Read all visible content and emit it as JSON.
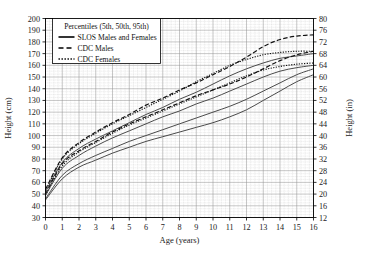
{
  "chart_data": {
    "type": "line",
    "title": "",
    "xlabel": "Age (years)",
    "ylabel": "Height (cm)",
    "ylabel_secondary": "Height (in)",
    "xlim": [
      0,
      16
    ],
    "ylim": [
      30,
      200
    ],
    "ylim_secondary": [
      12,
      80
    ],
    "xticks": [
      0,
      1,
      2,
      3,
      4,
      5,
      6,
      7,
      8,
      9,
      10,
      11,
      12,
      13,
      14,
      15,
      16
    ],
    "yticks": [
      30,
      40,
      50,
      60,
      70,
      80,
      90,
      100,
      110,
      120,
      130,
      140,
      150,
      160,
      170,
      180,
      190,
      200
    ],
    "yticks_secondary": [
      12,
      16,
      20,
      24,
      28,
      32,
      36,
      40,
      44,
      48,
      52,
      56,
      60,
      64,
      68,
      72,
      76,
      80
    ],
    "grid": true,
    "minor_grid_divisions": 4,
    "legend_position": "top-left",
    "legend_title": "Percentiles (5th, 50th, 95th)",
    "legend": [
      {
        "label": "SLOS Males and Females",
        "style": "solid"
      },
      {
        "label": "CDC Males",
        "style": "dashed"
      },
      {
        "label": "CDC Females",
        "style": "dotted"
      }
    ],
    "x": [
      0,
      1,
      2,
      3,
      4,
      5,
      6,
      7,
      8,
      9,
      10,
      11,
      12,
      13,
      14,
      15,
      16
    ],
    "series": [
      {
        "name": "CDC Males 95th",
        "style": "dashed",
        "values": [
          54,
          81,
          94,
          103,
          111,
          118,
          126,
          132,
          139,
          145,
          152,
          159,
          167,
          176,
          182,
          185,
          186
        ]
      },
      {
        "name": "CDC Females 95th",
        "style": "dotted",
        "values": [
          53,
          80,
          93,
          102,
          110,
          117,
          124,
          131,
          138,
          146,
          153,
          160,
          165,
          169,
          171,
          172,
          172
        ]
      },
      {
        "name": "SLOS Males and Females 95th",
        "style": "solid",
        "values": [
          52,
          77,
          89,
          97,
          104,
          111,
          118,
          124,
          131,
          137,
          144,
          151,
          157,
          162,
          166,
          168,
          170
        ]
      },
      {
        "name": "CDC Males 50th",
        "style": "dashed",
        "values": [
          50,
          76,
          87,
          95,
          103,
          110,
          116,
          122,
          128,
          134,
          139,
          144,
          150,
          157,
          164,
          169,
          172
        ]
      },
      {
        "name": "CDC Females 50th",
        "style": "dotted",
        "values": [
          49,
          74,
          86,
          94,
          102,
          109,
          115,
          121,
          127,
          133,
          139,
          145,
          151,
          156,
          159,
          161,
          162
        ]
      },
      {
        "name": "SLOS Males and Females 50th",
        "style": "solid",
        "values": [
          49,
          72,
          83,
          91,
          98,
          104,
          110,
          116,
          121,
          127,
          132,
          138,
          144,
          150,
          155,
          158,
          160
        ]
      },
      {
        "name": "SLOS Males and Females 5th",
        "style": "solid",
        "values": [
          46,
          66,
          76,
          83,
          89,
          95,
          100,
          105,
          110,
          115,
          120,
          125,
          131,
          138,
          145,
          152,
          157
        ]
      },
      {
        "name": "CDC 5th lower",
        "style": "solid",
        "values": [
          45,
          63,
          73,
          79,
          85,
          90,
          95,
          99,
          103,
          107,
          111,
          116,
          122,
          130,
          138,
          146,
          152
        ]
      }
    ]
  }
}
